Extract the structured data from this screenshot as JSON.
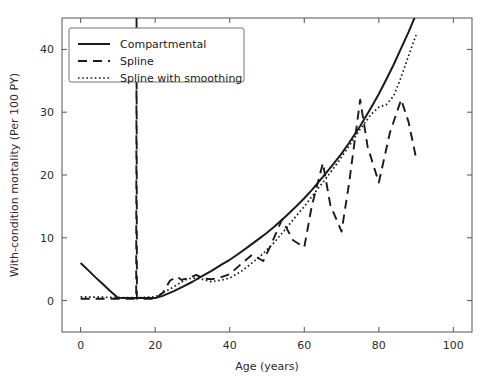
{
  "chart_data": {
    "type": "line",
    "title": "",
    "subtitle": "",
    "xlabel": "Age (years)",
    "ylabel": "With-condition mortality (Per 100 PY)",
    "xlim": [
      -5,
      105
    ],
    "ylim": [
      -5,
      45
    ],
    "xticks": [
      0,
      20,
      40,
      60,
      80,
      100
    ],
    "yticks": [
      0,
      10,
      20,
      30,
      40
    ],
    "xtick_labels": [
      "0",
      "20",
      "40",
      "60",
      "80",
      "100"
    ],
    "ytick_labels": [
      "0",
      "10",
      "20",
      "30",
      "40"
    ],
    "grid": false,
    "legend_position": "upper left",
    "line_color": "#1a1a1a",
    "frame_color": "#555555",
    "background": "#ffffff",
    "series": [
      {
        "name": "Compartmental",
        "style": "solid",
        "x": [
          0,
          2,
          4,
          6,
          8,
          10,
          12,
          15,
          18,
          20,
          22,
          25,
          28,
          30,
          32,
          35,
          38,
          40,
          42,
          45,
          48,
          50,
          52,
          55,
          58,
          60,
          62,
          65,
          68,
          70,
          72,
          75,
          78,
          80,
          82,
          84,
          86,
          88,
          90
        ],
        "y": [
          6.0,
          4.85,
          3.7,
          2.6,
          1.5,
          0.45,
          0.4,
          0.4,
          0.4,
          0.4,
          0.75,
          1.5,
          2.4,
          3.0,
          3.7,
          4.7,
          5.8,
          6.5,
          7.3,
          8.6,
          9.9,
          10.8,
          11.8,
          13.4,
          15.1,
          16.3,
          17.6,
          19.7,
          21.9,
          23.4,
          25.1,
          27.8,
          30.8,
          32.9,
          35.2,
          37.6,
          40.2,
          42.8,
          45.6
        ]
      },
      {
        "name": "Spline",
        "style": "dashed",
        "x": [
          0,
          5,
          10,
          14.9,
          15,
          15.1,
          20,
          22,
          24,
          26,
          27,
          29,
          31,
          33,
          35,
          37,
          40,
          43,
          46,
          49,
          51,
          54,
          57,
          60,
          62,
          65,
          67,
          70,
          72,
          75,
          77,
          80,
          83,
          86,
          88,
          90
        ],
        "y": [
          0.3,
          0.3,
          0.3,
          0.3,
          45.5,
          0.3,
          0.3,
          1.2,
          3.2,
          3.8,
          3.3,
          3.6,
          4.1,
          3.5,
          3.4,
          3.6,
          4.2,
          5.8,
          7.3,
          6.3,
          8.8,
          12.9,
          9.6,
          8.5,
          15.0,
          21.9,
          15.2,
          11.0,
          18.6,
          32.0,
          24.5,
          18.8,
          26.8,
          32.0,
          28.4,
          22.7
        ]
      },
      {
        "name": "Spline with smoothing",
        "style": "dotted",
        "x": [
          0,
          5,
          10,
          15,
          20,
          22,
          25,
          28,
          30,
          32,
          35,
          38,
          40,
          43,
          46,
          49,
          52,
          55,
          58,
          60,
          63,
          66,
          69,
          72,
          75,
          78,
          80,
          82,
          84,
          86,
          88,
          90
        ],
        "y": [
          0.6,
          0.55,
          0.5,
          0.45,
          0.6,
          1.2,
          2.2,
          3.3,
          3.6,
          3.5,
          3.0,
          3.3,
          3.6,
          4.6,
          6.0,
          7.5,
          9.3,
          11.4,
          13.6,
          15.0,
          17.3,
          19.6,
          22.0,
          24.6,
          27.3,
          29.7,
          30.8,
          31.2,
          32.6,
          35.6,
          39.0,
          42.3
        ]
      }
    ],
    "legend_entries": [
      {
        "label": "Compartmental",
        "style": "solid"
      },
      {
        "label": "Spline",
        "style": "dashed"
      },
      {
        "label": "Spline with smoothing",
        "style": "dotted"
      }
    ]
  }
}
